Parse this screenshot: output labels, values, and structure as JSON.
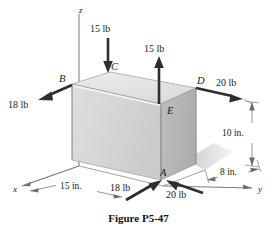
{
  "figure": {
    "caption": "Figure P5-47",
    "caption_x": 0,
    "caption_y": 212
  },
  "axes": [
    {
      "name": "z",
      "label": "z",
      "label_x": 79,
      "label_y": 6
    },
    {
      "name": "x",
      "label": "x",
      "label_x": 13,
      "label_y": 190
    },
    {
      "name": "y",
      "label": "y",
      "label_x": 258,
      "label_y": 190
    }
  ],
  "points": [
    {
      "name": "A",
      "label": "A",
      "label_x": 160,
      "label_y": 172
    },
    {
      "name": "B",
      "label": "B",
      "label_x": 59,
      "label_y": 81
    },
    {
      "name": "C",
      "label": "C",
      "label_x": 108,
      "label_y": 66
    },
    {
      "name": "D",
      "label": "D",
      "label_x": 197,
      "label_y": 80
    },
    {
      "name": "E",
      "label": "E",
      "label_x": 168,
      "label_y": 110
    }
  ],
  "forces": [
    {
      "name": "force-c-down",
      "label": "15 lb",
      "magnitude": 15,
      "unit": "lb",
      "applied_at": "C",
      "direction": "down",
      "label_x": 88,
      "label_y": 26
    },
    {
      "name": "force-e-up",
      "label": "15 lb",
      "magnitude": 15,
      "unit": "lb",
      "applied_at": "E",
      "direction": "up",
      "label_x": 152,
      "label_y": 46
    },
    {
      "name": "force-b-out",
      "label": "18 lb",
      "magnitude": 18,
      "unit": "lb",
      "applied_at": "B",
      "direction": "down-left",
      "label_x": 11,
      "label_y": 104
    },
    {
      "name": "force-d-out",
      "label": "20 lb",
      "magnitude": 20,
      "unit": "lb",
      "applied_at": "D",
      "direction": "right",
      "label_x": 218,
      "label_y": 81
    },
    {
      "name": "force-a-up-right",
      "label": "18 lb",
      "magnitude": 18,
      "unit": "lb",
      "applied_at": "A",
      "direction": "up-right",
      "label_x": 113,
      "label_y": 186
    },
    {
      "name": "force-a-left",
      "label": "20 lb",
      "magnitude": 20,
      "unit": "lb",
      "applied_at": "A",
      "direction": "left",
      "label_x": 167,
      "label_y": 192
    }
  ],
  "dimensions": [
    {
      "name": "dim-x-15in",
      "label": "15 in.",
      "value": 15,
      "unit": "in.",
      "axis": "x",
      "label_x": 62,
      "label_y": 184
    },
    {
      "name": "dim-y-8in",
      "label": "8 in.",
      "value": 8,
      "unit": "in.",
      "axis": "y",
      "label_x": 222,
      "label_y": 177
    },
    {
      "name": "dim-z-10in",
      "label": "10 in.",
      "value": 10,
      "unit": "in.",
      "axis": "z",
      "label_x": 243,
      "label_y": 133
    }
  ],
  "colors": {
    "stroke": "#3a3a3a",
    "arrow": "#2e2e2e",
    "face_front": "#d7d7d7",
    "face_right": "#b6b6b6",
    "face_top": "#e6e6e6",
    "shadow": "#cfcfcf",
    "text": "#1b1b1b",
    "background": "#ffffff"
  }
}
